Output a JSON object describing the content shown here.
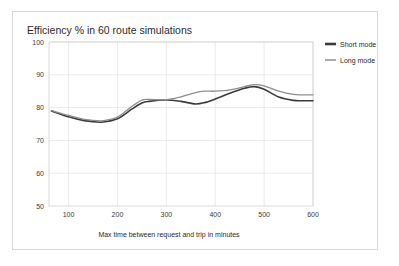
{
  "chart_data": {
    "type": "line",
    "title": "Efficiency % in 60 route simulations",
    "xlabel": "Max time between request and trip in minutes",
    "ylabel": "",
    "xlim": [
      60,
      600
    ],
    "ylim": [
      50,
      100
    ],
    "grid": true,
    "legend_position": "right",
    "xticks": [
      100,
      200,
      300,
      400,
      500,
      600
    ],
    "yticks": [
      50,
      60,
      70,
      80,
      90,
      100
    ],
    "x": [
      65,
      100,
      130,
      160,
      170,
      200,
      230,
      250,
      265,
      300,
      330,
      360,
      380,
      400,
      430,
      460,
      480,
      500,
      530,
      560,
      580,
      600
    ],
    "series": [
      {
        "name": "Short mode",
        "color": "#3b3b3b",
        "width": 1.6,
        "values": [
          79.0,
          77.2,
          76.1,
          75.6,
          75.6,
          76.6,
          79.6,
          81.4,
          81.9,
          82.3,
          81.9,
          81.1,
          81.6,
          82.6,
          84.4,
          85.9,
          86.4,
          85.6,
          83.2,
          82.2,
          82.1,
          82.1
        ]
      },
      {
        "name": "Long mode",
        "color": "#8e8e8e",
        "width": 1.3,
        "values": [
          79.1,
          77.6,
          76.5,
          76.0,
          76.0,
          77.1,
          80.4,
          82.3,
          82.5,
          82.4,
          83.3,
          84.6,
          85.0,
          85.0,
          85.4,
          86.4,
          87.0,
          86.6,
          85.0,
          84.0,
          83.9,
          83.9
        ]
      }
    ]
  },
  "legend": {
    "items": [
      {
        "label": "Short mode"
      },
      {
        "label": "Long mode"
      }
    ]
  }
}
